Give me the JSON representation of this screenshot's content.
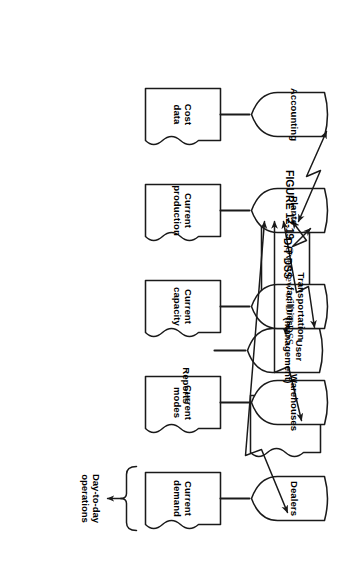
{
  "figure": {
    "number": "FIGURE 12-19",
    "caption": "Overview of D/T DSS.",
    "title": "Overview of D/T DSS"
  },
  "diagram": {
    "type": "flow-diagram",
    "orientation": "rotated-90-clockwise",
    "central_node": {
      "id": "dt-dss",
      "label": "D/T DSS",
      "shape": "rectangle"
    },
    "user_node": {
      "id": "user",
      "label_line1": "User",
      "label_line2": "(management)",
      "shape": "shield",
      "document": {
        "id": "reports",
        "label": "Reports",
        "shape": "document"
      },
      "connector": {
        "to": "dt-dss",
        "style": "straight",
        "arrows": "both"
      }
    },
    "operational_nodes": [
      {
        "id": "accounting",
        "label_line1": "Accounting",
        "label_line2": "",
        "shape": "shield",
        "document": {
          "id": "cost-data",
          "label_line1": "Cost",
          "label_line2": "data",
          "shape": "document"
        },
        "connector": {
          "to": "dt-dss",
          "style": "lightning-bolt",
          "arrows": "both"
        }
      },
      {
        "id": "plants",
        "label_line1": "Plants",
        "label_line2": "",
        "shape": "shield",
        "document": {
          "id": "current-production",
          "label_line1": "Current",
          "label_line2": "production",
          "shape": "document"
        },
        "connector": {
          "to": "dt-dss",
          "style": "lightning-bolt",
          "arrows": "both"
        }
      },
      {
        "id": "transportation-facilities",
        "label_line1": "Transportation",
        "label_line2": "facilities",
        "shape": "shield",
        "document": {
          "id": "current-capacity",
          "label_line1": "Current",
          "label_line2": "capacity",
          "shape": "document"
        },
        "connector": {
          "to": "dt-dss",
          "style": "lightning-bolt",
          "arrows": "both"
        }
      },
      {
        "id": "warehouses",
        "label_line1": "Warehouses",
        "label_line2": "",
        "shape": "shield",
        "document": {
          "id": "current-modes",
          "label_line1": "Current",
          "label_line2": "modes",
          "shape": "document"
        },
        "connector": {
          "to": "dt-dss",
          "style": "lightning-bolt",
          "arrows": "both"
        }
      },
      {
        "id": "dealers",
        "label_line1": "Dealers",
        "label_line2": "",
        "shape": "shield",
        "document": {
          "id": "current-demand",
          "label_line1": "Current",
          "label_line2": "demand",
          "shape": "document"
        },
        "connector": {
          "to": "dt-dss",
          "style": "lightning-bolt",
          "arrows": "both"
        }
      }
    ],
    "brace_annotation": {
      "label_line1": "Day-to-day",
      "label_line2": "operations",
      "points_to": "dealers"
    },
    "colors": {
      "stroke": "#1a1a1a",
      "fill": "#ffffff",
      "background": "#ffffff",
      "text": "#000000"
    }
  }
}
